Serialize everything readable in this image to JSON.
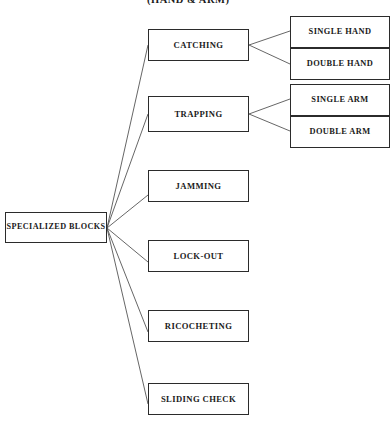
{
  "diagram": {
    "title": "(HAND & ARM)",
    "title_position": {
      "x": 147,
      "y": -6,
      "font_size": 10.5
    },
    "colors": {
      "background": "#ffffff",
      "border": "#2b2b2b",
      "text": "#1a1a1a",
      "edge": "#555555"
    },
    "root": {
      "id": "specialized-blocks",
      "label": "SPECIALIZED BLOCKS",
      "x": 5,
      "y": 212,
      "w": 102,
      "h": 31,
      "font_size": 8.2
    },
    "branches": [
      {
        "id": "catching",
        "label": "CATCHING",
        "x": 148,
        "y": 29,
        "w": 101,
        "h": 32,
        "font_size": 8.6,
        "children": [
          {
            "id": "single-hand",
            "label": "SINGLE HAND",
            "x": 290,
            "y": 16,
            "w": 100,
            "h": 32,
            "font_size": 8.4
          },
          {
            "id": "double-hand",
            "label": "DOUBLE HAND",
            "x": 290,
            "y": 48,
            "w": 100,
            "h": 32,
            "font_size": 8.4
          }
        ]
      },
      {
        "id": "trapping",
        "label": "TRAPPING",
        "x": 148,
        "y": 96,
        "w": 101,
        "h": 36,
        "font_size": 8.6,
        "children": [
          {
            "id": "single-arm",
            "label": "SINGLE ARM",
            "x": 290,
            "y": 84,
            "w": 100,
            "h": 32,
            "font_size": 8.4
          },
          {
            "id": "double-arm",
            "label": "DOUBLE ARM",
            "x": 290,
            "y": 116,
            "w": 100,
            "h": 32,
            "font_size": 8.4
          }
        ]
      },
      {
        "id": "jamming",
        "label": "JAMMING",
        "x": 148,
        "y": 170,
        "w": 101,
        "h": 32,
        "font_size": 8.6,
        "children": []
      },
      {
        "id": "lock-out",
        "label": "LOCK-OUT",
        "x": 148,
        "y": 240,
        "w": 101,
        "h": 32,
        "font_size": 8.6,
        "children": []
      },
      {
        "id": "ricocheting",
        "label": "RICOCHETING",
        "x": 148,
        "y": 310,
        "w": 101,
        "h": 32,
        "font_size": 8.6,
        "children": []
      },
      {
        "id": "sliding-check",
        "label": "SLIDING CHECK",
        "x": 148,
        "y": 383,
        "w": 101,
        "h": 32,
        "font_size": 8.6,
        "children": []
      }
    ],
    "edges": {
      "root_fan_origin": {
        "x": 107,
        "y": 228
      },
      "root_targets": [
        {
          "to": "catching",
          "x": 148,
          "y": 45
        },
        {
          "to": "trapping",
          "x": 148,
          "y": 114
        },
        {
          "to": "jamming",
          "x": 148,
          "y": 195
        },
        {
          "to": "lock-out",
          "x": 148,
          "y": 262
        },
        {
          "to": "ricocheting",
          "x": 148,
          "y": 332
        },
        {
          "to": "sliding-check",
          "x": 148,
          "y": 404
        }
      ],
      "sub_fans": [
        {
          "from": "catching",
          "origin": {
            "x": 249,
            "y": 45
          },
          "targets": [
            {
              "to": "single-hand",
              "x": 290,
              "y": 31
            },
            {
              "to": "double-hand",
              "x": 290,
              "y": 64
            }
          ]
        },
        {
          "from": "trapping",
          "origin": {
            "x": 249,
            "y": 114
          },
          "targets": [
            {
              "to": "single-arm",
              "x": 290,
              "y": 99
            },
            {
              "to": "double-arm",
              "x": 290,
              "y": 131
            }
          ]
        }
      ]
    }
  }
}
